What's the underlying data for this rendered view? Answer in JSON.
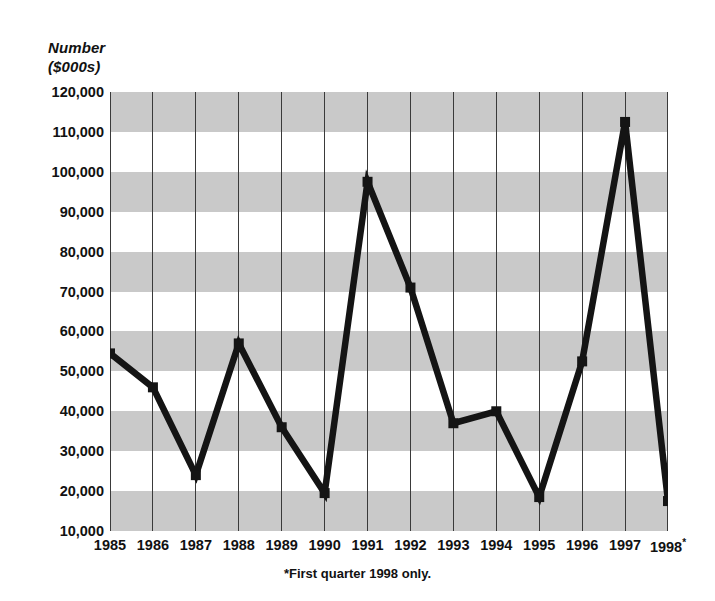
{
  "figure": {
    "axis_caption": "Number\n($000s)",
    "footnote": "*First quarter 1998 only."
  },
  "chart_data": {
    "type": "line",
    "title": "",
    "subtitle": "",
    "xlabel": "",
    "ylabel": "Number ($000s)",
    "categories": [
      "1985",
      "1986",
      "1987",
      "1988",
      "1989",
      "1990",
      "1991",
      "1992",
      "1993",
      "1994",
      "1995",
      "1996",
      "1997",
      "1998*"
    ],
    "values": [
      54500,
      46000,
      24000,
      57000,
      36000,
      19500,
      97500,
      71000,
      37000,
      40000,
      18500,
      52500,
      112500,
      17500
    ],
    "series": [
      {
        "name": "Number ($000s)",
        "values": [
          54500,
          46000,
          24000,
          57000,
          36000,
          19500,
          97500,
          71000,
          37000,
          40000,
          18500,
          52500,
          112500,
          17500
        ]
      }
    ],
    "ylim": [
      10000,
      120000
    ],
    "ytick_labels": [
      "120,000",
      "110,000",
      "100,000",
      "90,000",
      "80,000",
      "70,000",
      "60,000",
      "50,000",
      "40,000",
      "30,000",
      "20,000",
      "10,000"
    ],
    "ytick_values": [
      120000,
      110000,
      100000,
      90000,
      80000,
      70000,
      60000,
      50000,
      40000,
      30000,
      20000,
      10000
    ],
    "xtick_labels": [
      "1985",
      "1986",
      "1987",
      "1988",
      "1989",
      "1990",
      "1991",
      "1992",
      "1993",
      "1994",
      "1995",
      "1996",
      "1997",
      "1998"
    ],
    "xtick_last_superscript": "*",
    "grid": "vertical gridlines at each year; alternating horizontal gray bands every 10,000",
    "legend": "none",
    "annotations": [
      "*First quarter 1998 only."
    ],
    "colors": {
      "line": "#141414",
      "marker": "#141414",
      "band": "#c9c9c9",
      "background": "#ffffff",
      "gridline": "#3a3a3a",
      "axis": "#111111"
    }
  }
}
